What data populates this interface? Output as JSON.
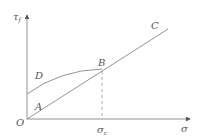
{
  "diagram": {
    "type": "shear-strength envelope",
    "y_axis_label": "τ",
    "y_axis_label_sub": "f",
    "x_axis_label": "σ",
    "origin_label": "O",
    "points": {
      "A": "A",
      "B": "B",
      "C": "C",
      "D": "D"
    },
    "sigma_c_label": "σ",
    "sigma_c_sub": "c",
    "colors": {
      "line": "#777777",
      "text": "#555555",
      "background": "#ffffff"
    }
  }
}
